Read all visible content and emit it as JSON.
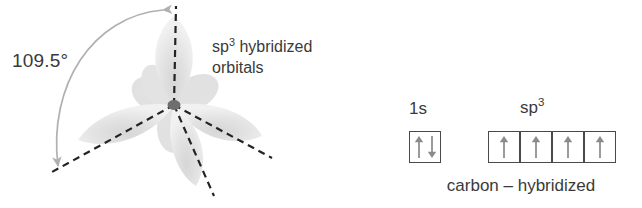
{
  "figure": {
    "colors": {
      "lobe_fill": "#e2e2e2",
      "lobe_back_fill": "#cfcfcf",
      "bond_line": "#232323",
      "arc_arrow": "#b0b0b0",
      "node": "#6e6e6e",
      "box_border": "#4a4a4a",
      "spin_arrow": "#8a8a8a",
      "text": "#3a3a3a"
    }
  },
  "orbital_panel": {
    "name": "sp3-orbital-geometry",
    "angle_label": "109.5°",
    "caption_line1_pre": "sp",
    "caption_line1_sup": "3",
    "caption_line1_post": " hybridized",
    "caption_line2": "orbitals",
    "center": {
      "x": 174,
      "y": 105
    },
    "lobes": [
      {
        "name": "lobe-up",
        "angle_deg": -90,
        "length": 96,
        "width": 46
      },
      {
        "name": "lobe-lower-left",
        "angle_deg": 158,
        "length": 92,
        "width": 44
      },
      {
        "name": "lobe-lower-right",
        "angle_deg": 26,
        "length": 90,
        "width": 44
      },
      {
        "name": "lobe-down",
        "angle_deg": 74,
        "length": 88,
        "width": 42
      }
    ],
    "bond_lines": [
      {
        "name": "bond-up",
        "x2": 176,
        "y2": 6
      },
      {
        "name": "bond-lower-left",
        "x2": 52,
        "y2": 172
      },
      {
        "name": "bond-lower-right",
        "x2": 272,
        "y2": 158
      },
      {
        "name": "bond-down",
        "x2": 214,
        "y2": 196
      }
    ],
    "arc_arrow": {
      "name": "angle-arc-double-arrow",
      "from": {
        "x": 163,
        "y": 9
      },
      "to": {
        "x": 57,
        "y": 168
      },
      "double_headed": true
    }
  },
  "config_panel": {
    "name": "carbon-hybridized-orbital-boxes",
    "groups": [
      {
        "name": "group-1s",
        "label": "1s",
        "label_sup": "",
        "boxes": [
          {
            "name": "box-1s",
            "spins": [
              "up",
              "down"
            ]
          }
        ]
      },
      {
        "name": "group-sp3",
        "label": "sp",
        "label_sup": "3",
        "boxes": [
          {
            "name": "box-sp3-1",
            "spins": [
              "up"
            ]
          },
          {
            "name": "box-sp3-2",
            "spins": [
              "up"
            ]
          },
          {
            "name": "box-sp3-3",
            "spins": [
              "up"
            ]
          },
          {
            "name": "box-sp3-4",
            "spins": [
              "up"
            ]
          }
        ]
      }
    ],
    "caption": "carbon – hybridized"
  }
}
